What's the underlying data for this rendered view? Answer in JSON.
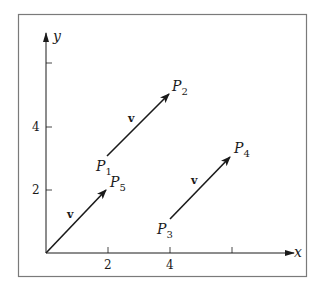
{
  "figure": {
    "axes": {
      "x_label": "x",
      "y_label": "y",
      "x_ticks": [
        {
          "value": 2,
          "label": "2"
        },
        {
          "value": 4,
          "label": "4"
        },
        {
          "value": 6,
          "label": ""
        }
      ],
      "y_ticks": [
        {
          "value": 2,
          "label": "2"
        },
        {
          "value": 4,
          "label": "4"
        },
        {
          "value": 6,
          "label": ""
        }
      ]
    },
    "vector_name": "v",
    "points": {
      "P1": {
        "base": "P",
        "sub": "1",
        "coords": [
          2,
          3
        ]
      },
      "P2": {
        "base": "P",
        "sub": "2",
        "coords": [
          4,
          5
        ]
      },
      "P3": {
        "base": "P",
        "sub": "3",
        "coords": [
          4,
          1
        ]
      },
      "P4": {
        "base": "P",
        "sub": "4",
        "coords": [
          6,
          3
        ]
      },
      "P5": {
        "base": "P",
        "sub": "5",
        "coords": [
          2,
          2
        ]
      }
    },
    "arrows": [
      {
        "from": "origin",
        "to": "P5",
        "label": "v"
      },
      {
        "from": "P1",
        "to": "P2",
        "label": "v"
      },
      {
        "from": "P3",
        "to": "P4",
        "label": "v"
      }
    ],
    "colors": {
      "ink": "#1a1a1a",
      "frame": "#7a7a7a",
      "background": "#ffffff"
    }
  }
}
